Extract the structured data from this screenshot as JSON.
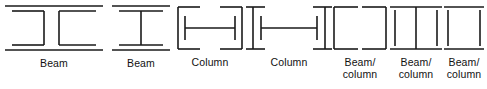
{
  "figure": {
    "background_color": "#ffffff",
    "line_color": "#1a1a1a",
    "label_color": "#111111",
    "shape_count": 7
  },
  "shapes": [
    {
      "id": "wide-flange-beam",
      "label": "Beam",
      "section_type": "wide-flange I-section (beam orientation)",
      "orientation": "horizontal flanges, two vertical webs",
      "web_count": 2
    },
    {
      "id": "narrow-flange-beam",
      "label": "Beam",
      "section_type": "narrow-flange I-section (beam orientation)",
      "orientation": "horizontal flanges, single vertical web",
      "web_count": 1
    },
    {
      "id": "wide-flange-column",
      "label": "Column",
      "section_type": "wide-flange H-section (column orientation)",
      "orientation": "vertical flanges, horizontal web",
      "web_count": 1
    },
    {
      "id": "narrow-flange-column",
      "label": "Column",
      "section_type": "narrow-flange H-section (column orientation)",
      "orientation": "vertical flanges, horizontal web",
      "web_count": 1
    },
    {
      "id": "hollow-square-tube",
      "label": "Beam/\ncolumn",
      "section_type": "hollow structural square tube",
      "orientation": "closed box section",
      "web_count": 0
    },
    {
      "id": "hollow-tube-with-divider",
      "label": "Beam/\ncolumn",
      "section_type": "hollow structural square tube with central stiffener",
      "orientation": "closed box section, vertical divider",
      "web_count": 1
    },
    {
      "id": "hollow-square-tube-tall",
      "label": "Beam/\ncolumn",
      "section_type": "hollow structural square tube",
      "orientation": "closed box section",
      "web_count": 0
    }
  ]
}
